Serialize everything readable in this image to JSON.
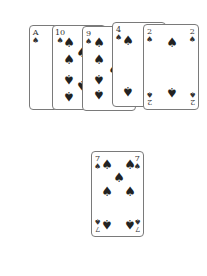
{
  "table": {
    "hand": [
      {
        "rank": "A",
        "suit": "♠",
        "name": "ace-of-spades"
      },
      {
        "rank": "10",
        "suit": "♠",
        "name": "ten-of-spades"
      },
      {
        "rank": "9",
        "suit": "♠",
        "name": "nine-of-spades"
      },
      {
        "rank": "4",
        "suit": "♠",
        "name": "four-of-spades"
      },
      {
        "rank": "2",
        "suit": "♠",
        "name": "two-of-spades"
      }
    ],
    "played": {
      "rank": "7",
      "suit": "♠",
      "name": "seven-of-spades"
    }
  }
}
